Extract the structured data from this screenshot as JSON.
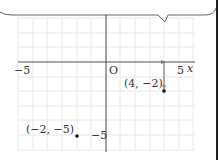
{
  "diagram": {
    "type": "coordinate-plane",
    "x_axis_label": "x",
    "origin_label": "O",
    "tick_labels": {
      "x_neg": "−5",
      "x_pos": "5",
      "y_neg": "−5"
    },
    "points": [
      {
        "label": "(4, −2)",
        "x": 4,
        "y": -2
      },
      {
        "label": "(−2, −5)",
        "x": -2,
        "y": -5
      }
    ],
    "colors": {
      "axis": "#555555",
      "grid": "#e6e6e6",
      "point": "#111111",
      "text": "#333333"
    }
  }
}
